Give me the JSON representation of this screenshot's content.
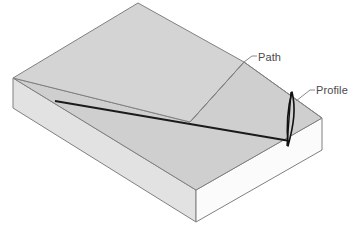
{
  "figure": {
    "type": "isometric-block-diagram",
    "background_color": "#ffffff"
  },
  "labels": {
    "path": "Path",
    "profile": "Profile"
  },
  "colors": {
    "top_face_upper": "#d4d4d4",
    "top_face_lower": "#cfcfcf",
    "front_left_face": "#e2e2e2",
    "front_right_face": "#fbfbfb",
    "outline": "#808080",
    "path_line": "#1a1a1a",
    "profile_line": "#111111",
    "leader_line": "#8a8a8a",
    "label_text": "#4a4a4a"
  },
  "geometry": {
    "top_back_vertex": "138,3",
    "top_left_vertex": "13,78",
    "top_right_vertex": "322,118",
    "top_front_vertex": "196,190",
    "bottom_left_vertex": "13,108",
    "bottom_front_vertex": "196,222",
    "bottom_right_vertex": "322,150",
    "crease_start": "190,122",
    "crease_end": "244,62",
    "path_start": "55,101",
    "path_end": "290,141",
    "profile_top": "292,92",
    "profile_bottom": "288,146"
  },
  "annotations": [
    {
      "name": "path-leader",
      "from": "244,62",
      "to": "256,56",
      "label": "Path"
    },
    {
      "name": "profile-leader",
      "from": "297,100",
      "to": "314,89",
      "label": "Profile"
    }
  ]
}
